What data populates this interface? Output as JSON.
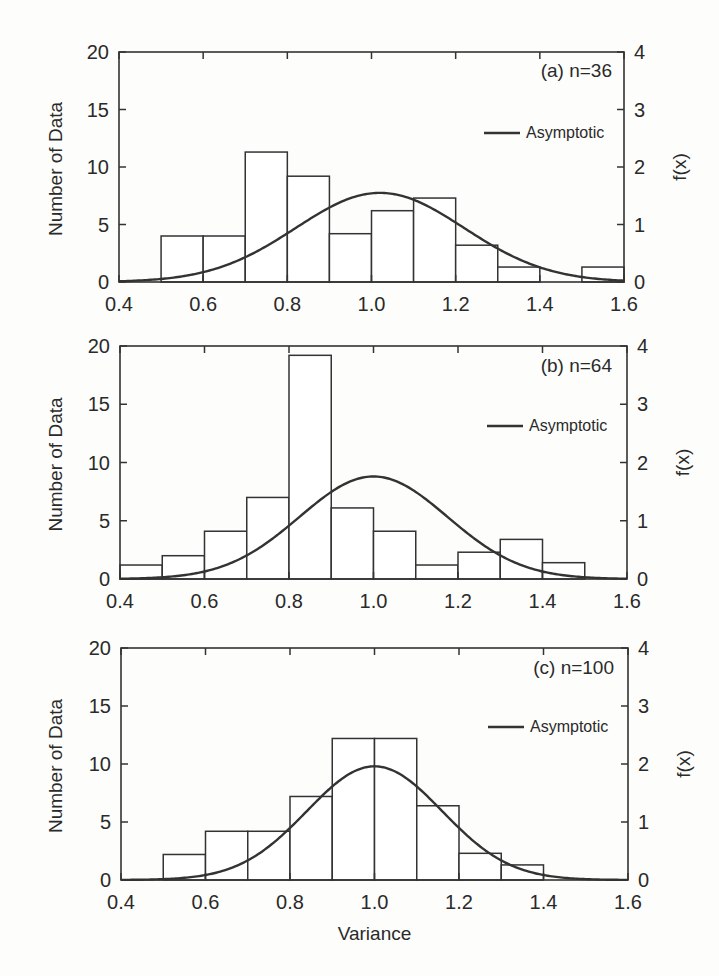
{
  "figure": {
    "xlabel": "Variance",
    "ylabel_left": "Number of Data",
    "ylabel_right": "f(x)",
    "legend_label": "Asymptotic"
  },
  "chart_data": [
    {
      "type": "bar",
      "title": "(a) n=36",
      "xlabel": "",
      "ylabel": "Number of Data",
      "ylabel_right": "f(x)",
      "xlim": [
        0.4,
        1.6
      ],
      "ylim": [
        0,
        20
      ],
      "ylim_right": [
        0,
        4
      ],
      "x_ticks": [
        "0.4",
        "0.6",
        "0.8",
        "1.0",
        "1.2",
        "1.4",
        "1.6"
      ],
      "y_ticks": [
        "0",
        "5",
        "10",
        "15",
        "20"
      ],
      "y_ticks_right": [
        "0",
        "1",
        "2",
        "3",
        "4"
      ],
      "bin_edges": [
        0.4,
        0.5,
        0.6,
        0.7,
        0.8,
        0.9,
        1.0,
        1.1,
        1.2,
        1.3,
        1.4,
        1.5,
        1.6
      ],
      "values": [
        0,
        4.0,
        4.0,
        11.3,
        9.2,
        4.2,
        6.2,
        7.3,
        3.2,
        1.3,
        0,
        1.3
      ],
      "series": [
        {
          "name": "Histogram",
          "type": "bar",
          "values": [
            0,
            4.0,
            4.0,
            11.3,
            9.2,
            4.2,
            6.2,
            7.3,
            3.2,
            1.3,
            0,
            1.3
          ]
        },
        {
          "name": "Asymptotic",
          "type": "line",
          "axis": "right",
          "mean": 1.02,
          "sd": 0.2,
          "peak": 1.55
        }
      ],
      "legend_position": "upper right",
      "grid": false
    },
    {
      "type": "bar",
      "title": "(b) n=64",
      "xlabel": "",
      "ylabel": "Number of Data",
      "ylabel_right": "f(x)",
      "xlim": [
        0.4,
        1.6
      ],
      "ylim": [
        0,
        20
      ],
      "ylim_right": [
        0,
        4
      ],
      "x_ticks": [
        "0.4",
        "0.6",
        "0.8",
        "1.0",
        "1.2",
        "1.4",
        "1.6"
      ],
      "y_ticks": [
        "0",
        "5",
        "10",
        "15",
        "20"
      ],
      "y_ticks_right": [
        "0",
        "1",
        "2",
        "3",
        "4"
      ],
      "bin_edges": [
        0.4,
        0.5,
        0.6,
        0.7,
        0.8,
        0.9,
        1.0,
        1.1,
        1.2,
        1.3,
        1.4,
        1.5,
        1.6
      ],
      "values": [
        1.2,
        2.0,
        4.1,
        7.0,
        19.2,
        6.1,
        4.1,
        1.2,
        2.3,
        3.4,
        1.4,
        0
      ],
      "series": [
        {
          "name": "Histogram",
          "type": "bar",
          "values": [
            1.2,
            2.0,
            4.1,
            7.0,
            19.2,
            6.1,
            4.1,
            1.2,
            2.3,
            3.4,
            1.4,
            0
          ]
        },
        {
          "name": "Asymptotic",
          "type": "line",
          "axis": "right",
          "mean": 1.0,
          "sd": 0.175,
          "peak": 1.76
        }
      ],
      "legend_position": "upper right",
      "grid": false
    },
    {
      "type": "bar",
      "title": "(c) n=100",
      "xlabel": "Variance",
      "ylabel": "Number of Data",
      "ylabel_right": "f(x)",
      "xlim": [
        0.4,
        1.6
      ],
      "ylim": [
        0,
        20
      ],
      "ylim_right": [
        0,
        4
      ],
      "x_ticks": [
        "0.4",
        "0.6",
        "0.8",
        "1.0",
        "1.2",
        "1.4",
        "1.6"
      ],
      "y_ticks": [
        "0",
        "5",
        "10",
        "15",
        "20"
      ],
      "y_ticks_right": [
        "0",
        "1",
        "2",
        "3",
        "4"
      ],
      "bin_edges": [
        0.4,
        0.5,
        0.6,
        0.7,
        0.8,
        0.9,
        1.0,
        1.1,
        1.2,
        1.3,
        1.4,
        1.5,
        1.6
      ],
      "values": [
        0,
        2.2,
        4.2,
        4.2,
        7.2,
        12.2,
        12.2,
        6.4,
        2.3,
        1.3,
        0,
        0
      ],
      "series": [
        {
          "name": "Histogram",
          "type": "bar",
          "values": [
            0,
            2.2,
            4.2,
            4.2,
            7.2,
            12.2,
            12.2,
            6.4,
            2.3,
            1.3,
            0,
            0
          ]
        },
        {
          "name": "Asymptotic",
          "type": "line",
          "axis": "right",
          "mean": 1.0,
          "sd": 0.16,
          "peak": 1.96
        }
      ],
      "legend_position": "upper right",
      "grid": false
    }
  ],
  "panels_layout": [
    {
      "left": 119,
      "right": 624,
      "top": 52,
      "bottom": 282,
      "label_x": 612,
      "label_y": 77,
      "legend_y": 133
    },
    {
      "left": 120,
      "right": 627,
      "top": 346,
      "bottom": 579,
      "label_x": 612,
      "label_y": 372,
      "legend_y": 426
    },
    {
      "left": 121,
      "right": 628,
      "top": 648,
      "bottom": 880,
      "label_x": 614,
      "label_y": 674,
      "legend_y": 727
    }
  ]
}
